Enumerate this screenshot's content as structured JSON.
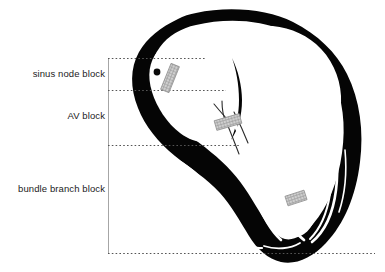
{
  "diagram": {
    "colors": {
      "myocardium": "#050505",
      "background": "#ffffff",
      "chamber": "#ffffff",
      "leader_line": "#4d4d4d",
      "bracket_line": "#9a9a9a",
      "block_marker_fill": "#c8c8c8",
      "block_marker_stroke": "#8a8a8a",
      "label_text": "#1b1b1b"
    },
    "labels": [
      {
        "id": "sinus-node-block",
        "text": "sinus node block",
        "leader_y": 58
      },
      {
        "id": "av-block",
        "text": "AV block",
        "leader_y": 90
      },
      {
        "id": "bundle-branch-block",
        "text": "bundle branch block",
        "leader_y": 145
      }
    ],
    "bracket": {
      "x": 108,
      "top": 58,
      "bottom": 253
    },
    "leader_lines": [
      {
        "name": "sinus-node-leader",
        "y": 58,
        "x1": 108,
        "x2": 206
      },
      {
        "name": "av-leader",
        "y": 90,
        "x1": 108,
        "x2": 226
      },
      {
        "name": "bundle-branch-leader",
        "y": 145,
        "x1": 108,
        "x2": 241
      },
      {
        "name": "base-leader",
        "y": 253,
        "x1": 108,
        "x2": 375
      }
    ],
    "markers": [
      {
        "name": "sinus-node-block-marker",
        "cx": 170,
        "cy": 78,
        "w": 9,
        "h": 28,
        "rotate": 22
      },
      {
        "name": "av-block-marker",
        "cx": 228,
        "cy": 122,
        "w": 10,
        "h": 26,
        "rotate": 74
      },
      {
        "name": "bundle-branch-block-marker",
        "cx": 296,
        "cy": 198,
        "w": 10,
        "h": 20,
        "rotate": 72
      }
    ],
    "sinus_node_dot": {
      "name": "sinus-node-dot",
      "cx": 157,
      "cy": 72,
      "r": 3.4
    }
  }
}
